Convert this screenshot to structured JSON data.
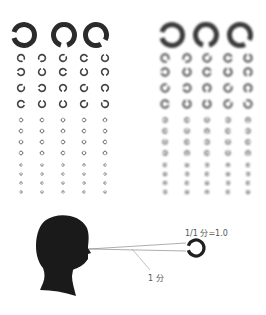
{
  "charts": {
    "left": {
      "style": "sharp",
      "color": "#2b2b2b"
    },
    "right": {
      "style": "blurred",
      "color": "#3a3a3a"
    }
  },
  "big_row": {
    "y": 35,
    "r": 10.5,
    "stroke": 5,
    "gaps": [
      "left",
      "bottom",
      "bottom-right"
    ],
    "left_x": [
      24,
      64,
      96
    ],
    "right_x": [
      172,
      206,
      240
    ]
  },
  "small_columns": {
    "left_x": [
      21,
      42,
      63,
      84,
      105
    ],
    "right_x": [
      165,
      187,
      207,
      228,
      248
    ]
  },
  "small_rows": [
    {
      "y": 58,
      "r": 3.4,
      "stroke": 1.6,
      "gaps": [
        "bottom-right",
        "bottom-left",
        "top-right",
        "right",
        "top"
      ]
    },
    {
      "y": 72,
      "r": 3.4,
      "stroke": 1.6,
      "gaps": [
        "left",
        "top",
        "right",
        "top",
        "bottom"
      ]
    },
    {
      "y": 88,
      "r": 3.4,
      "stroke": 1.6,
      "gaps": [
        "top-right",
        "left",
        "bottom",
        "top-right",
        "bottom"
      ]
    },
    {
      "y": 104,
      "r": 3.4,
      "stroke": 1.6,
      "gaps": [
        "right",
        "top",
        "top",
        "top-right",
        "top-left"
      ]
    },
    {
      "y": 120,
      "r": 1.8,
      "stroke": 0.9,
      "gaps": [
        "left",
        "right",
        "top",
        "left",
        "bottom"
      ]
    },
    {
      "y": 131,
      "r": 1.8,
      "stroke": 0.9,
      "gaps": [
        "right",
        "top",
        "bottom",
        "right",
        "left"
      ]
    },
    {
      "y": 142,
      "r": 1.8,
      "stroke": 0.9,
      "gaps": [
        "top",
        "right",
        "left",
        "top",
        "right"
      ]
    },
    {
      "y": 153,
      "r": 1.8,
      "stroke": 0.9,
      "gaps": [
        "left",
        "bottom",
        "right",
        "top",
        "bottom"
      ]
    },
    {
      "y": 165,
      "r": 1.2,
      "stroke": 0.7,
      "gaps": [
        "right",
        "top",
        "left",
        "bottom",
        "right"
      ]
    },
    {
      "y": 174,
      "r": 1.2,
      "stroke": 0.7,
      "gaps": [
        "top",
        "left",
        "right",
        "top",
        "left"
      ]
    },
    {
      "y": 183,
      "r": 1.2,
      "stroke": 0.7,
      "gaps": [
        "bottom",
        "right",
        "top",
        "left",
        "right"
      ]
    },
    {
      "y": 192,
      "r": 1.2,
      "stroke": 0.7,
      "gaps": [
        "left",
        "top",
        "bottom",
        "right",
        "top"
      ]
    }
  ],
  "illustration": {
    "ring": {
      "cx": 196,
      "cy": 248,
      "r": 8,
      "stroke": 3.2,
      "gap": "left"
    },
    "label_acuity": "1/1 分=1.0",
    "label_angle": "1 分",
    "colors": {
      "silhouette": "#1a1a1a",
      "line": "#888888"
    }
  }
}
